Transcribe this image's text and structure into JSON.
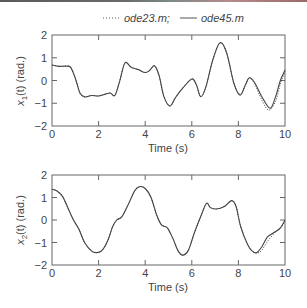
{
  "legend": {
    "ode23_label": "ode23.m;",
    "ode45_label": "ode45.m"
  },
  "chart_data": [
    {
      "type": "line",
      "title": "",
      "xlabel": "Time (s)",
      "ylabel": "x1(t) (rad.)",
      "ylabel_parts": {
        "var": "x",
        "sub": "1",
        "rest": "(t) (rad.)"
      },
      "xlim": [
        0,
        10
      ],
      "ylim": [
        -2,
        2
      ],
      "xticks": [
        0,
        2,
        4,
        6,
        8,
        10
      ],
      "yticks": [
        -2,
        -1,
        0,
        1,
        2
      ],
      "grid": false,
      "legend_position": "top-center (above first subplot)",
      "series": [
        {
          "name": "ode45.m",
          "style": "solid",
          "x": [
            0,
            0.3,
            0.6,
            0.8,
            1.0,
            1.2,
            1.4,
            1.7,
            2.0,
            2.3,
            2.5,
            2.7,
            2.9,
            3.13,
            3.4,
            3.7,
            4.0,
            4.2,
            4.4,
            4.6,
            4.8,
            5.06,
            5.3,
            5.6,
            6.0,
            6.2,
            6.38,
            6.6,
            6.9,
            7.21,
            7.5,
            7.8,
            8.07,
            8.3,
            8.47,
            8.7,
            9.0,
            9.36,
            9.6,
            9.8,
            10.0
          ],
          "y": [
            0.68,
            0.62,
            0.63,
            0.58,
            0.1,
            -0.55,
            -0.72,
            -0.66,
            -0.68,
            -0.6,
            -0.55,
            -0.65,
            -0.05,
            0.77,
            0.58,
            0.48,
            0.35,
            0.45,
            0.65,
            0.2,
            -0.7,
            -1.12,
            -0.75,
            -0.35,
            0.07,
            -0.2,
            -0.71,
            -0.3,
            0.9,
            1.66,
            1.2,
            -0.1,
            -0.64,
            -0.2,
            0.12,
            -0.1,
            -0.7,
            -1.22,
            -0.7,
            0.0,
            0.46
          ]
        },
        {
          "name": "ode23.m",
          "style": "dotted",
          "x": [
            0,
            0.3,
            0.6,
            0.8,
            1.0,
            1.2,
            1.4,
            1.7,
            2.0,
            2.3,
            2.5,
            2.7,
            2.9,
            3.13,
            3.4,
            3.7,
            4.0,
            4.2,
            4.4,
            4.6,
            4.8,
            5.06,
            5.3,
            5.6,
            6.0,
            6.2,
            6.38,
            6.6,
            6.9,
            7.21,
            7.5,
            7.8,
            8.07,
            8.3,
            8.47,
            8.7,
            9.0,
            9.3,
            9.6,
            9.8,
            10.0
          ],
          "y": [
            0.68,
            0.62,
            0.63,
            0.58,
            0.1,
            -0.55,
            -0.72,
            -0.66,
            -0.68,
            -0.6,
            -0.55,
            -0.65,
            -0.05,
            0.77,
            0.58,
            0.48,
            0.35,
            0.45,
            0.65,
            0.2,
            -0.7,
            -1.12,
            -0.75,
            -0.35,
            0.07,
            -0.2,
            -0.71,
            -0.3,
            0.9,
            1.66,
            1.2,
            -0.1,
            -0.64,
            -0.2,
            0.12,
            -0.15,
            -0.85,
            -1.3,
            -0.9,
            -0.15,
            0.38
          ]
        }
      ]
    },
    {
      "type": "line",
      "title": "",
      "xlabel": "Time (s)",
      "ylabel": "x2(t) (rad.)",
      "ylabel_parts": {
        "var": "x",
        "sub": "2",
        "rest": "(t) (rad.)"
      },
      "xlim": [
        0,
        10
      ],
      "ylim": [
        -2,
        2
      ],
      "xticks": [
        0,
        2,
        4,
        6,
        8,
        10
      ],
      "yticks": [
        -2,
        -1,
        0,
        1,
        2
      ],
      "grid": false,
      "series": [
        {
          "name": "ode45.m",
          "style": "solid",
          "x": [
            0,
            0.2,
            0.45,
            0.7,
            0.92,
            1.15,
            1.4,
            1.7,
            1.92,
            2.15,
            2.4,
            2.6,
            2.78,
            3.0,
            3.3,
            3.55,
            3.75,
            4.0,
            4.25,
            4.5,
            4.7,
            4.95,
            5.2,
            5.4,
            5.6,
            5.85,
            6.1,
            6.4,
            6.63,
            6.8,
            7.06,
            7.4,
            7.71,
            7.9,
            8.1,
            8.4,
            8.6,
            8.78,
            9.0,
            9.25,
            9.58,
            9.8,
            10.0
          ],
          "y": [
            1.36,
            1.3,
            1.05,
            0.5,
            0.0,
            -0.4,
            -1.0,
            -1.38,
            -1.45,
            -1.35,
            -0.9,
            -0.3,
            0.0,
            0.15,
            0.75,
            1.3,
            1.48,
            1.4,
            1.0,
            0.2,
            -0.22,
            -0.35,
            -0.85,
            -1.35,
            -1.56,
            -1.35,
            -0.6,
            0.2,
            0.74,
            0.55,
            0.49,
            0.6,
            0.86,
            0.6,
            -0.3,
            -1.1,
            -1.38,
            -1.45,
            -1.2,
            -0.75,
            -0.52,
            -0.35,
            0.0
          ]
        },
        {
          "name": "ode23.m",
          "style": "dotted",
          "x": [
            0,
            0.2,
            0.45,
            0.7,
            0.92,
            1.15,
            1.4,
            1.7,
            1.92,
            2.15,
            2.4,
            2.6,
            2.78,
            3.0,
            3.3,
            3.55,
            3.75,
            4.0,
            4.25,
            4.5,
            4.7,
            4.95,
            5.2,
            5.4,
            5.6,
            5.85,
            6.1,
            6.4,
            6.63,
            6.8,
            7.06,
            7.4,
            7.71,
            7.9,
            8.1,
            8.4,
            8.6,
            8.78,
            9.0,
            9.25,
            9.58,
            9.8,
            10.0
          ],
          "y": [
            1.36,
            1.3,
            1.05,
            0.5,
            0.0,
            -0.4,
            -1.0,
            -1.38,
            -1.45,
            -1.35,
            -0.9,
            -0.3,
            0.0,
            0.15,
            0.75,
            1.3,
            1.48,
            1.4,
            1.0,
            0.2,
            -0.22,
            -0.35,
            -0.85,
            -1.35,
            -1.56,
            -1.35,
            -0.6,
            0.2,
            0.74,
            0.55,
            0.49,
            0.62,
            0.86,
            0.6,
            -0.3,
            -1.1,
            -1.4,
            -1.48,
            -1.35,
            -0.95,
            -0.55,
            -0.38,
            -0.05
          ]
        }
      ]
    }
  ]
}
